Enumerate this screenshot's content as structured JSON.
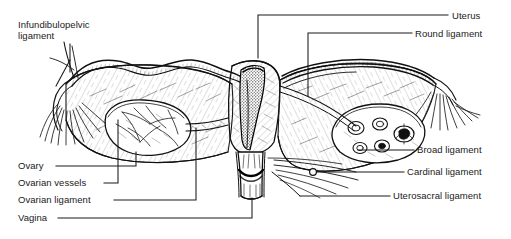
{
  "figure": {
    "type": "anatomical-line-drawing",
    "view": "posterior coronal view",
    "width": 511,
    "height": 239,
    "background_color": "#ffffff",
    "ink_color": "#1a1a1a"
  },
  "labels": [
    {
      "id": "infundibulopelvic-ligament",
      "text_line1": "Infundibulopelvic",
      "text_line2": "ligament",
      "side": "left",
      "x": 18,
      "y": 19
    },
    {
      "id": "uterus",
      "text": "Uterus",
      "side": "right",
      "x": 452,
      "y": 11
    },
    {
      "id": "round-ligament",
      "text": "Round ligament",
      "side": "right",
      "x": 415,
      "y": 30
    },
    {
      "id": "broad-ligament",
      "text": "Broad ligament",
      "side": "right",
      "x": 417,
      "y": 150
    },
    {
      "id": "cardinal-ligament",
      "text": "Cardinal ligament",
      "side": "right",
      "x": 407,
      "y": 173
    },
    {
      "id": "uterosacral-ligament",
      "text": "Uterosacral ligament",
      "side": "right",
      "x": 393,
      "y": 196
    },
    {
      "id": "ovary",
      "text": "Ovary",
      "side": "left",
      "x": 18,
      "y": 166
    },
    {
      "id": "ovarian-vessels",
      "text": "Ovarian vessels",
      "side": "left",
      "x": 18,
      "y": 183
    },
    {
      "id": "ovarian-ligament",
      "text": "Ovarian ligament",
      "side": "left",
      "x": 18,
      "y": 200
    },
    {
      "id": "vagina",
      "text": "Vagina",
      "side": "left",
      "x": 18,
      "y": 218
    }
  ],
  "structures": [
    {
      "id": "left-fimbriae",
      "name": "Left fimbriae"
    },
    {
      "id": "left-fallopian-tube",
      "name": "Left fallopian tube"
    },
    {
      "id": "left-ovary",
      "name": "Left ovary"
    },
    {
      "id": "left-broad-ligament",
      "name": "Left broad ligament"
    },
    {
      "id": "uterine-body",
      "name": "Uterine body (sectioned)"
    },
    {
      "id": "endometrial-cavity",
      "name": "Endometrial cavity"
    },
    {
      "id": "cervix",
      "name": "Cervix"
    },
    {
      "id": "vaginal-canal",
      "name": "Vaginal canal (sectioned)"
    },
    {
      "id": "right-broad-ligament",
      "name": "Right broad ligament"
    },
    {
      "id": "right-ovary",
      "name": "Right ovary (sectioned, follicles visible)"
    },
    {
      "id": "right-fallopian-tube",
      "name": "Right fallopian tube"
    },
    {
      "id": "right-fimbriae",
      "name": "Right fimbriae"
    },
    {
      "id": "right-round-ligament",
      "name": "Right round ligament"
    },
    {
      "id": "cardinal-ligament-marker",
      "name": "Cardinal ligament marker"
    }
  ]
}
